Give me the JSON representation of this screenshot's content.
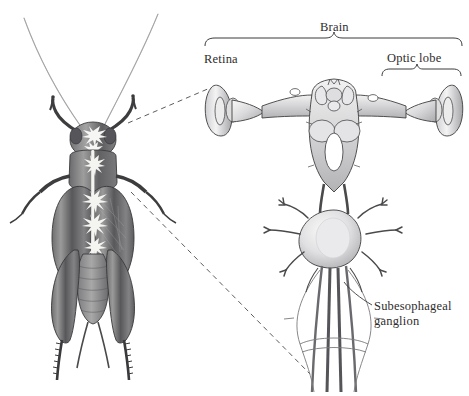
{
  "figure": {
    "type": "scientific-illustration",
    "background_color": "#ffffff",
    "ink_color": "#2e2c2d"
  },
  "labels": {
    "brain": "Brain",
    "retina": "Retina",
    "optic_lobe": "Optic lobe",
    "subesophageal_line1": "Subesophageal",
    "subesophageal_line2": "ganglion"
  },
  "panels": {
    "left": {
      "name": "cricket-habitus",
      "description": "Dorsal view of a cricket with ventral nerve cord and ganglia highlighted in white"
    },
    "right": {
      "name": "brain-diagram",
      "description": "Enlarged dorsal view of cricket brain, optic lobes, retinas, subesophageal ganglion and nerve cords"
    }
  },
  "leaders": {
    "upper": "dashed line from cricket head to left retina",
    "lower": "dashed line from cricket thorax to nerve cord base"
  },
  "braces": {
    "brain_span": "spans whole brain including both optic lobes",
    "optic_lobe_span": "spans right optic lobe only"
  }
}
